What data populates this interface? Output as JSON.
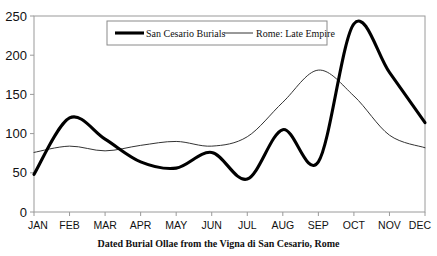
{
  "chart_data": {
    "type": "line",
    "title": "",
    "caption": "Dated Burial Ollae from the Vigna di San Cesario, Rome",
    "xlabel": "",
    "ylabel": "",
    "categories": [
      "JAN",
      "FEB",
      "MAR",
      "APR",
      "MAY",
      "JUN",
      "JUL",
      "AUG",
      "SEP",
      "OCT",
      "NOV",
      "DEC"
    ],
    "ylim": [
      0,
      250
    ],
    "yticks": [
      0,
      50,
      100,
      150,
      200,
      250
    ],
    "grid": false,
    "legend_position": "top-center",
    "smoothing": "spline",
    "series": [
      {
        "name": "San Cesario Burials",
        "style": "thick",
        "color": "#000000",
        "values": [
          48,
          120,
          93,
          64,
          56,
          76,
          42,
          105,
          64,
          240,
          178,
          114
        ]
      },
      {
        "name": "Rome: Late Empire",
        "style": "thin",
        "color": "#333333",
        "values": [
          76,
          84,
          78,
          85,
          90,
          84,
          96,
          140,
          181,
          148,
          98,
          82
        ]
      }
    ]
  },
  "axis": {
    "y_tick_labels": [
      "250",
      "200",
      "150",
      "100",
      "50",
      "0"
    ],
    "x_tick_labels": [
      "JAN",
      "FEB",
      "MAR",
      "APR",
      "MAY",
      "JUN",
      "JUL",
      "AUG",
      "SEP",
      "OCT",
      "NOV",
      "DEC"
    ]
  },
  "legend": {
    "items": [
      {
        "label": "San Cesario Burials"
      },
      {
        "label": "Rome: Late Empire"
      }
    ]
  },
  "caption": {
    "text": "Dated Burial Ollae from the Vigna di San Cesario, Rome"
  }
}
